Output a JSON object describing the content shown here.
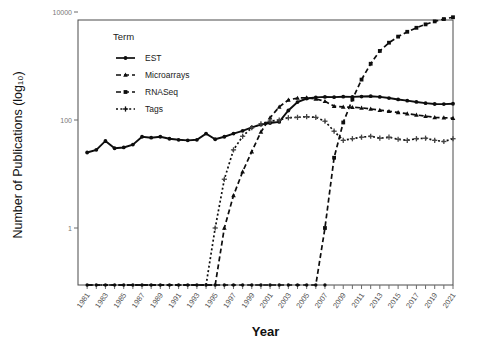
{
  "chart_data": {
    "type": "line",
    "title": "",
    "xlabel": "Year",
    "ylabel": "Number of Publications (log10)",
    "ylabel_display": "Number of Publications (log₁₀)",
    "legend_title": "Term",
    "legend_position": "top-left-inside",
    "grid": false,
    "yscale": "log",
    "ylim": [
      0.3,
      10000
    ],
    "ytick_values": [
      1,
      100,
      10000
    ],
    "ytick_labels": [
      "1",
      "100",
      "10000"
    ],
    "xlim": [
      1980,
      2021
    ],
    "x": [
      1981,
      1982,
      1983,
      1984,
      1985,
      1986,
      1987,
      1988,
      1989,
      1990,
      1991,
      1992,
      1993,
      1994,
      1995,
      1996,
      1997,
      1998,
      1999,
      2000,
      2001,
      2002,
      2003,
      2004,
      2005,
      2006,
      2007,
      2008,
      2009,
      2010,
      2011,
      2012,
      2013,
      2014,
      2015,
      2016,
      2017,
      2018,
      2019,
      2020,
      2021
    ],
    "xtick_labels": [
      "1981",
      "1983",
      "1985",
      "1987",
      "1989",
      "1991",
      "1993",
      "1995",
      "1997",
      "1999",
      "2001",
      "2003",
      "2005",
      "2007",
      "2009",
      "2011",
      "2013",
      "2015",
      "2017",
      "2019",
      "2021"
    ],
    "series": [
      {
        "name": "EST",
        "marker": "circle",
        "linestyle": "solid",
        "color": "#0d0d0d",
        "values": [
          25,
          28,
          41,
          30,
          31,
          35,
          49,
          47,
          49,
          45,
          43,
          42,
          43,
          56,
          44,
          49,
          56,
          63,
          73,
          82,
          88,
          92,
          150,
          215,
          250,
          262,
          268,
          265,
          270,
          268,
          272,
          276,
          268,
          255,
          240,
          228,
          216,
          205,
          198,
          197,
          200
        ]
      },
      {
        "name": "Microarrays",
        "marker": "triangle",
        "linestyle": "dashed",
        "color": "#0d0d0d",
        "values": [
          null,
          null,
          null,
          null,
          null,
          null,
          null,
          null,
          null,
          null,
          null,
          null,
          null,
          null,
          null,
          1,
          4,
          11,
          26,
          60,
          110,
          175,
          235,
          255,
          258,
          245,
          222,
          180,
          175,
          172,
          168,
          160,
          152,
          145,
          138,
          131,
          124,
          118,
          112,
          110,
          108
        ]
      },
      {
        "name": "RNASeq",
        "marker": "square",
        "linestyle": "dashed",
        "color": "#0d0d0d",
        "values": [
          null,
          null,
          null,
          null,
          null,
          null,
          null,
          null,
          null,
          null,
          null,
          null,
          null,
          null,
          null,
          null,
          null,
          null,
          null,
          null,
          null,
          null,
          null,
          null,
          null,
          null,
          1,
          20,
          90,
          240,
          560,
          1100,
          1900,
          2700,
          3500,
          4300,
          5100,
          5900,
          6700,
          7400,
          8000
        ]
      },
      {
        "name": "Tags",
        "marker": "plus",
        "linestyle": "dotted",
        "color": "#444444",
        "values": [
          null,
          null,
          null,
          null,
          null,
          null,
          null,
          null,
          null,
          null,
          null,
          null,
          null,
          null,
          1,
          8,
          28,
          50,
          72,
          85,
          95,
          100,
          110,
          112,
          115,
          112,
          95,
          62,
          42,
          45,
          48,
          50,
          46,
          48,
          44,
          42,
          45,
          46,
          42,
          40,
          45
        ]
      }
    ],
    "baseline_note": "missing (zero) values plotted on bottom baseline"
  },
  "legend": {
    "title": "Term",
    "entries": [
      {
        "label": "EST",
        "marker": "circle",
        "linestyle": "solid"
      },
      {
        "label": "Microarrays",
        "marker": "triangle",
        "linestyle": "dashed"
      },
      {
        "label": "RNASeq",
        "marker": "square",
        "linestyle": "dashed"
      },
      {
        "label": "Tags",
        "marker": "plus",
        "linestyle": "dotted"
      }
    ]
  },
  "axes": {
    "x_title": "Year",
    "y_title": "Number of Publications (log₁₀)"
  }
}
